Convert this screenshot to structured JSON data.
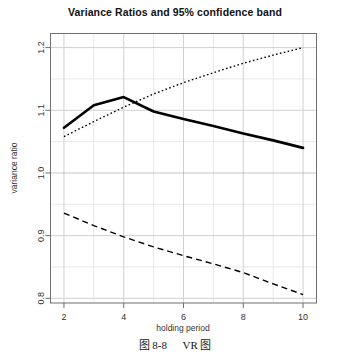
{
  "figure": {
    "caption_label": "图 8-8",
    "caption_text": "VR 图"
  },
  "chart_data": {
    "type": "line",
    "title": "Variance Ratios and 95% confidence band",
    "xlabel": "holding period",
    "ylabel": "variance ratio",
    "xlim": [
      1.55,
      10.45
    ],
    "ylim": [
      0.7925,
      1.2225
    ],
    "xticks": [
      2,
      4,
      6,
      8,
      10
    ],
    "xtick_labels": [
      "2",
      "4",
      "6",
      "8",
      "10"
    ],
    "yticks": [
      0.8,
      0.9,
      1.0,
      1.1,
      1.2
    ],
    "ytick_labels": [
      "0.8",
      "0.9",
      "1.0",
      "1.1",
      "1.2"
    ],
    "grid": true,
    "grid_minor": true,
    "reference_line_y": 1.0,
    "legend": "none",
    "x": [
      2,
      3,
      4,
      5,
      6,
      7,
      8,
      9,
      10
    ],
    "series": [
      {
        "name": "variance ratio",
        "style": "solid",
        "width": 2.6,
        "color": "#000000",
        "values": [
          1.072,
          1.108,
          1.121,
          1.098,
          1.086,
          1.075,
          1.063,
          1.052,
          1.04
        ]
      },
      {
        "name": "upper 95% confidence band",
        "style": "dotted",
        "width": 1.4,
        "color": "#000000",
        "values": [
          1.058,
          1.082,
          1.105,
          1.126,
          1.144,
          1.16,
          1.175,
          1.188,
          1.2
        ]
      },
      {
        "name": "lower 95% confidence band",
        "style": "dashed",
        "width": 1.4,
        "color": "#000000",
        "values": [
          0.936,
          0.916,
          0.898,
          0.882,
          0.868,
          0.855,
          0.841,
          0.823,
          0.806
        ]
      }
    ]
  },
  "colors": {
    "frame": "#6f6f6f",
    "grid_major": "#d0d0d0",
    "grid_minor": "#e8e8e8",
    "reference": "#8a8a8a",
    "line": "#000000"
  }
}
